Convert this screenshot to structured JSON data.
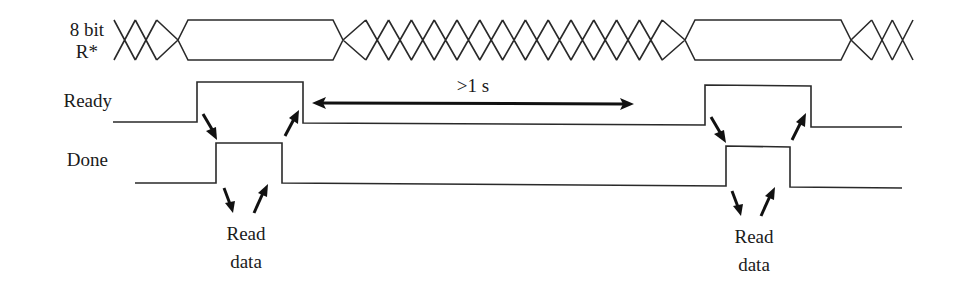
{
  "signals": {
    "bus": {
      "label_line1": "8 bit",
      "label_line2": "R*",
      "segments": [
        {
          "state": "changing",
          "cycles": 3
        },
        {
          "state": "valid"
        },
        {
          "state": "changing",
          "cycles": 15
        },
        {
          "state": "valid"
        },
        {
          "state": "changing",
          "cycles": 3
        }
      ]
    },
    "ready": {
      "label": "Ready",
      "levels": [
        "low",
        "high",
        "low",
        "high",
        "low"
      ]
    },
    "done": {
      "label": "Done",
      "levels": [
        "low",
        "high",
        "low",
        "high",
        "low"
      ]
    }
  },
  "annotations": {
    "interval_label": ">1 s",
    "read_data_left": {
      "line1": "Read",
      "line2": "data"
    },
    "read_data_right": {
      "line1": "Read",
      "line2": "data"
    }
  },
  "colors": {
    "line": "#2a2a2a",
    "arrow": "#111111",
    "text": "#1a1a1a",
    "background": "#ffffff"
  }
}
